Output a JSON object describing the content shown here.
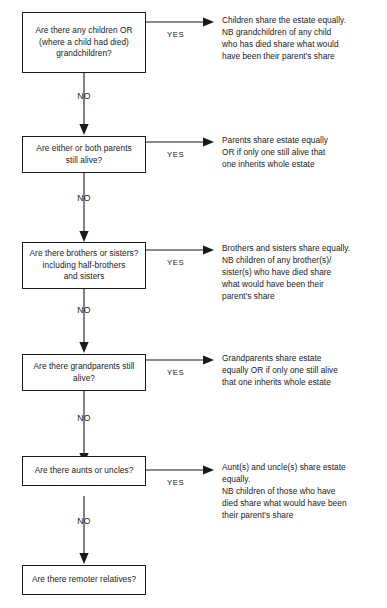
{
  "diagram": {
    "accent_color": "#1a1a1a",
    "background_color": "#ffffff",
    "yes_label": "YES",
    "no_label_left": "N",
    "no_label_right": "O"
  },
  "nodes": [
    {
      "id": "children",
      "question": "Are there any children OR\n(where a child had died)\ngrandchildren?",
      "yes_label": "YES",
      "outcome": "Children share the estate equally.\nNB grandchildren of any child\nwho has died share what would\nhave been their parent's share",
      "no_label": "NO"
    },
    {
      "id": "parents",
      "question": "Are either or both parents\nstill alive?",
      "yes_label": "YES",
      "outcome": "Parents share estate equally\nOR if only one still alive that\none inherits whole estate",
      "no_label": "NO"
    },
    {
      "id": "siblings",
      "question": "Are there brothers or sisters?\nincluding half-brothers\nand sisters",
      "yes_label": "YES",
      "outcome": "Brothers and sisters share equally.\nNB children of any brother(s)/\nsister(s) who have died share\nwhat would have been their\nparent's share",
      "no_label": "NO"
    },
    {
      "id": "grandparents",
      "question": "Are there grandparents still\nalive?",
      "yes_label": "YES",
      "outcome": "Grandparents share estate\nequally OR if only one still alive\nthat one inherits whole estate",
      "no_label": "NO"
    },
    {
      "id": "aunts-uncles",
      "question": "Are there aunts or uncles?",
      "yes_label": "YES",
      "outcome": "Aunt(s) and uncle(s) share estate\nequally.\nNB children of those who have\ndied share what would have been\ntheir parent's share",
      "no_label": "NO"
    },
    {
      "id": "remoter-relatives",
      "question": "Are there remoter relatives?",
      "yes_label": "",
      "outcome": "",
      "no_label": ""
    }
  ]
}
